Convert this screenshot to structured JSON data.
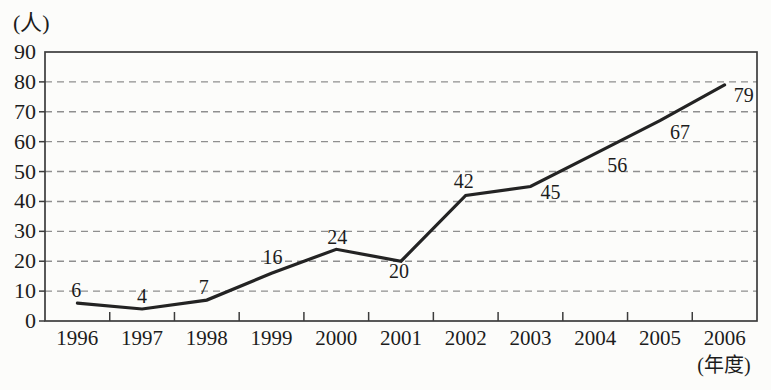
{
  "chart_data": {
    "type": "line",
    "title": "",
    "ylabel": "(人)",
    "xlabel": "(年度)",
    "categories": [
      "1996",
      "1997",
      "1998",
      "1999",
      "2000",
      "2001",
      "2002",
      "2003",
      "2004",
      "2005",
      "2006"
    ],
    "values": [
      6,
      4,
      7,
      16,
      24,
      20,
      42,
      45,
      56,
      67,
      79
    ],
    "point_labels": [
      "6",
      "4",
      "7",
      "16",
      "24",
      "20",
      "42",
      "45",
      "56",
      "67",
      "79"
    ],
    "ylim": [
      0,
      90
    ],
    "yticks": [
      0,
      10,
      20,
      30,
      40,
      50,
      60,
      70,
      80,
      90
    ],
    "grid": "horizontal-dashed",
    "legend": "none",
    "colors": {
      "line": "#232323",
      "frame": "#3c3c3c",
      "grid": "#8f8f8f",
      "text": "#1c1c1c",
      "background": "#fcfcfa"
    },
    "label_offsets": [
      [
        -1,
        -6
      ],
      [
        0,
        -6
      ],
      [
        -3,
        -6
      ],
      [
        1,
        -9
      ],
      [
        1,
        -5
      ],
      [
        -2,
        17
      ],
      [
        -2,
        -7
      ],
      [
        20,
        12
      ],
      [
        22,
        18
      ],
      [
        20,
        18
      ],
      [
        19,
        17
      ]
    ]
  }
}
